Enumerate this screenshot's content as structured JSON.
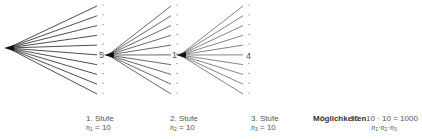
{
  "diagram": {
    "type": "tree",
    "branches_per_node": 10,
    "root": {
      "x": 8,
      "y": 48
    },
    "stages": [
      {
        "label": "1. Stufe",
        "var": "n",
        "sub": "1",
        "value": "10",
        "node_label": "5",
        "start": {
          "x": 8,
          "y": 48
        },
        "end_x": 97,
        "dot_x": 103
      },
      {
        "label": "2. Stufe",
        "var": "n",
        "sub": "2",
        "value": "10",
        "node_label": "1",
        "start": {
          "x": 108,
          "y": 55
        },
        "end_x": 171,
        "dot_x": 177
      },
      {
        "label": "3. Stufe",
        "var": "n",
        "sub": "3",
        "value": "10",
        "node_label": "4",
        "start": {
          "x": 180,
          "y": 55
        },
        "end_x": 243,
        "dot_x": 249
      }
    ],
    "possibilities": {
      "label": "Möglichkeiten",
      "formula": "10 · 10 · 10 = 1000",
      "symbolic": [
        "n",
        "1",
        "n",
        "2",
        "n",
        "3"
      ]
    }
  }
}
